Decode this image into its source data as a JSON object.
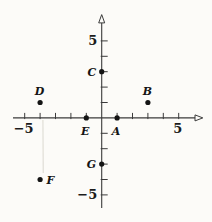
{
  "chart_data": {
    "type": "scatter",
    "title": "",
    "xlabel": "",
    "ylabel": "",
    "grid": false,
    "legend": false,
    "points": [
      {
        "name": "A",
        "x": 1,
        "y": 0,
        "label_position": "below"
      },
      {
        "name": "B",
        "x": 3,
        "y": 1,
        "label_position": "above"
      },
      {
        "name": "C",
        "x": 0,
        "y": 3,
        "label_position": "left"
      },
      {
        "name": "D",
        "x": -4,
        "y": 1,
        "label_position": "above"
      },
      {
        "name": "E",
        "x": -1,
        "y": 0,
        "label_position": "below"
      },
      {
        "name": "F",
        "x": -4,
        "y": -4,
        "label_position": "right"
      },
      {
        "name": "G",
        "x": 0,
        "y": -3,
        "label_position": "left"
      }
    ],
    "x_axis": {
      "tick_min": -5,
      "tick_max": 5,
      "tick_step": 1,
      "labeled_ticks": [
        {
          "value": -5,
          "text": "−5"
        },
        {
          "value": 5,
          "text": "5"
        }
      ]
    },
    "y_axis": {
      "tick_min": -5,
      "tick_max": 5,
      "tick_step": 1,
      "labeled_ticks": [
        {
          "value": 5,
          "text": "5"
        },
        {
          "value": -5,
          "text": "−5"
        }
      ]
    },
    "colors": {
      "axis": "#3b3b3b",
      "point": "#141414",
      "label": "#141414",
      "background": "#fcfbf8",
      "artifact": "#e4e2db"
    }
  }
}
